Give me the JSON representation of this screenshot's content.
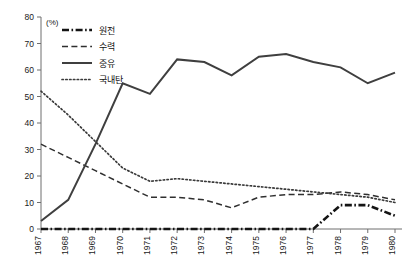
{
  "chart_data": {
    "type": "line",
    "title": "",
    "subtitle": "",
    "xlabel": "",
    "ylabel": "",
    "unit_label": "(%)",
    "grid": false,
    "legend_position": "top-left",
    "ylim": [
      0,
      80
    ],
    "ytick_step": 10,
    "yticks": [
      "0",
      "10",
      "20",
      "30",
      "40",
      "50",
      "60",
      "70",
      "80"
    ],
    "categories": [
      "1967",
      "1968",
      "1969",
      "1970",
      "1971",
      "1972",
      "1973",
      "1974",
      "1975",
      "1976",
      "1977",
      "1978",
      "1979",
      "1980"
    ],
    "series": [
      {
        "name": "원전",
        "style": "dash-dot-thick",
        "color": "#141414",
        "values": [
          0,
          0,
          0,
          0,
          0,
          0,
          0,
          0,
          0,
          0,
          0,
          9,
          9,
          5
        ]
      },
      {
        "name": "수력",
        "style": "dashed",
        "color": "#2f2f2f",
        "values": [
          32,
          27,
          22,
          17,
          12,
          12,
          11,
          8,
          12,
          13,
          13,
          14,
          13,
          11
        ]
      },
      {
        "name": "중유",
        "style": "solid",
        "color": "#3f3f3f",
        "values": [
          3,
          11,
          32,
          55,
          51,
          64,
          63,
          58,
          65,
          66,
          63,
          61,
          55,
          59
        ]
      },
      {
        "name": "국내탄",
        "style": "dotted",
        "color": "#3a3a3a",
        "values": [
          52,
          43,
          33,
          23,
          18,
          19,
          18,
          17,
          16,
          15,
          14,
          13,
          12,
          10
        ]
      }
    ]
  },
  "legend": {
    "items": [
      {
        "label": "원전",
        "icon": "dash-dot-thick-line-icon"
      },
      {
        "label": "수력",
        "icon": "dashed-line-icon"
      },
      {
        "label": "중유",
        "icon": "solid-line-icon"
      },
      {
        "label": "국내탄",
        "icon": "dotted-line-icon"
      }
    ]
  }
}
